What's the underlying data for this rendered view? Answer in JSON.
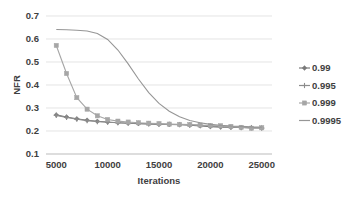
{
  "chart_data": {
    "type": "line",
    "title": "",
    "xlabel": "Iterations",
    "ylabel": "NFR",
    "xlim": [
      4000,
      26000
    ],
    "ylim": [
      0.1,
      0.7
    ],
    "xticks": [
      5000,
      10000,
      15000,
      20000,
      25000
    ],
    "xtick_labels": [
      "5000",
      "10000",
      "15000",
      "20000",
      "25000"
    ],
    "yticks": [
      0.1,
      0.2,
      0.3,
      0.4,
      0.5,
      0.6,
      0.7
    ],
    "ytick_labels": [
      "0.1",
      "0.2",
      "0.3",
      "0.4",
      "0.5",
      "0.6",
      "0.7"
    ],
    "grid": "horizontal",
    "legend_position": "right",
    "x": [
      5000,
      6000,
      7000,
      8000,
      9000,
      10000,
      11000,
      12000,
      13000,
      14000,
      15000,
      16000,
      17000,
      18000,
      19000,
      20000,
      21000,
      22000,
      23000,
      24000,
      25000
    ],
    "series": [
      {
        "name": "0.99",
        "color": "#7a7a7a",
        "marker": "diamond",
        "values": [
          0.27,
          0.261,
          0.253,
          0.247,
          0.242,
          0.239,
          0.236,
          0.234,
          0.232,
          0.231,
          0.229,
          0.228,
          0.227,
          0.225,
          0.222,
          0.219,
          0.217,
          0.216,
          0.215,
          0.214,
          0.213
        ]
      },
      {
        "name": "0.995",
        "color": "#8c8c8c",
        "marker": "plus",
        "values": [
          0.268,
          0.259,
          0.251,
          0.245,
          0.241,
          0.238,
          0.236,
          0.234,
          0.233,
          0.231,
          0.23,
          0.229,
          0.228,
          0.227,
          0.225,
          0.222,
          0.219,
          0.217,
          0.215,
          0.214,
          0.213
        ]
      },
      {
        "name": "0.999",
        "color": "#a6a6a6",
        "marker": "square",
        "values": [
          0.572,
          0.45,
          0.345,
          0.295,
          0.266,
          0.25,
          0.243,
          0.239,
          0.236,
          0.234,
          0.232,
          0.23,
          0.229,
          0.228,
          0.226,
          0.224,
          0.223,
          0.22,
          0.216,
          0.212,
          0.214
        ]
      },
      {
        "name": "0.9995",
        "color": "#969696",
        "marker": "none",
        "values": [
          0.641,
          0.64,
          0.638,
          0.635,
          0.624,
          0.598,
          0.552,
          0.492,
          0.426,
          0.367,
          0.32,
          0.286,
          0.262,
          0.246,
          0.236,
          0.229,
          0.225,
          0.222,
          0.22,
          0.218,
          0.217
        ]
      }
    ]
  },
  "legend": {
    "entries": [
      {
        "label": "0.99"
      },
      {
        "label": "0.995"
      },
      {
        "label": "0.999"
      },
      {
        "label": "0.9995"
      }
    ]
  }
}
